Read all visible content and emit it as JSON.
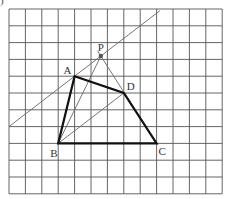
{
  "figure_label": ")",
  "grid": {
    "cols": 13,
    "rows": 11,
    "x0": 9,
    "y0": 9,
    "cell_w": 16.4,
    "cell_h": 16.8,
    "color": "#555555"
  },
  "points": {
    "A": {
      "label": "A",
      "col": 4,
      "row": 4
    },
    "B": {
      "label": "B",
      "col": 3,
      "row": 8
    },
    "C": {
      "label": "C",
      "col": 9,
      "row": 8
    },
    "D": {
      "label": "D",
      "col": 7,
      "row": 5
    },
    "P": {
      "label": "P",
      "col": 5.6,
      "row": 2.8
    }
  },
  "quadrilateral": [
    "A",
    "D",
    "C",
    "B"
  ],
  "thin_lines": [
    {
      "name": "line-through-A-parallel-BD",
      "from": [
        0,
        7
      ],
      "to": [
        9.2,
        0.1
      ]
    },
    {
      "name": "segment-B-D",
      "from": "B",
      "to": "D"
    },
    {
      "name": "segment-B-P",
      "from": "B",
      "to": "P"
    },
    {
      "name": "line-C-P",
      "from": "C",
      "to": "P",
      "extend": 0.3
    }
  ],
  "colors": {
    "bold": "#111111",
    "thin": "#666666",
    "point": "#555555"
  }
}
